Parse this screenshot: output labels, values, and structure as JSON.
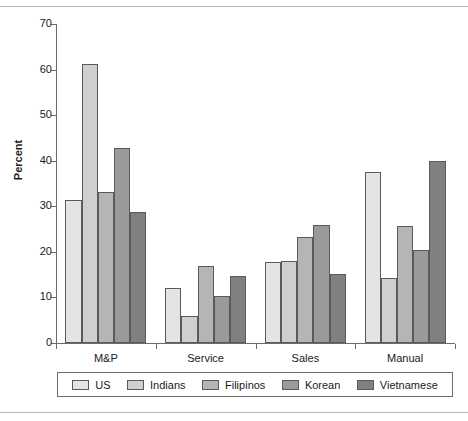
{
  "chart_data": {
    "type": "bar",
    "title": "",
    "subtitle": "",
    "xlabel": "",
    "ylabel": "Percent",
    "ylim": [
      0,
      70
    ],
    "yticks": [
      0,
      10,
      20,
      30,
      40,
      50,
      60,
      70
    ],
    "ytick_labels": [
      "0",
      "10",
      "20",
      "30",
      "40",
      "50",
      "60",
      "70"
    ],
    "grid": false,
    "legend_position": "bottom",
    "categories": [
      "M&P",
      "Service",
      "Sales",
      "Manual"
    ],
    "series": [
      {
        "name": "US",
        "color": "#e4e4e4",
        "values": [
          31.4,
          12.0,
          17.7,
          37.5
        ]
      },
      {
        "name": "Indians",
        "color": "#cfcfcf",
        "values": [
          61.3,
          6.0,
          17.9,
          14.3
        ]
      },
      {
        "name": "Filipinos",
        "color": "#b5b5b5",
        "values": [
          33.1,
          17.0,
          23.2,
          25.6
        ]
      },
      {
        "name": "Korean",
        "color": "#9a9a9a",
        "values": [
          42.8,
          10.3,
          26.0,
          20.4
        ]
      },
      {
        "name": "Vietnamese",
        "color": "#808080",
        "values": [
          28.7,
          14.8,
          15.2,
          40.0
        ]
      }
    ]
  },
  "legend": {
    "items": [
      {
        "label": "US"
      },
      {
        "label": "Indians"
      },
      {
        "label": "Filipinos"
      },
      {
        "label": "Korean"
      },
      {
        "label": "Vietnamese"
      }
    ]
  }
}
